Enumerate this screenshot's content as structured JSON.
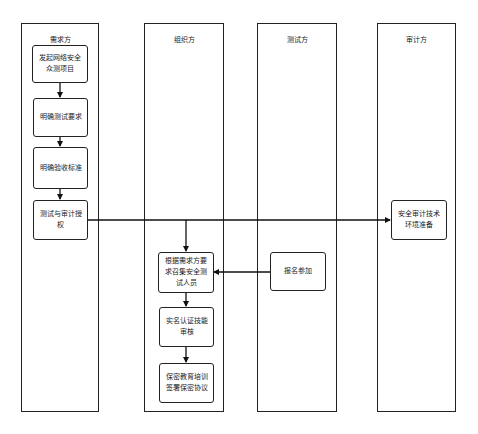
{
  "diagram": {
    "type": "swimlane-flowchart",
    "lanes": [
      {
        "id": "demand",
        "title": "需求方"
      },
      {
        "id": "organizer",
        "title": "组织方"
      },
      {
        "id": "tester",
        "title": "测试方"
      },
      {
        "id": "auditor",
        "title": "审计方"
      }
    ],
    "nodes": {
      "launch": "发起网络安全众测项目",
      "define_test": "明确测试要求",
      "define_accept": "明确验收标准",
      "authorize": "测试与审计授权",
      "audit_prep": "安全审计技术环境准备",
      "recruit": "根据需求方要求召集安全测试人员",
      "signup": "报名参加",
      "verify": "实名认证技能审核",
      "nda": "保密教育培训签署保密协议"
    },
    "edges": [
      {
        "from": "launch",
        "to": "define_test"
      },
      {
        "from": "define_test",
        "to": "define_accept"
      },
      {
        "from": "define_accept",
        "to": "authorize"
      },
      {
        "from": "authorize",
        "to": "audit_prep"
      },
      {
        "from": "authorize",
        "to": "recruit"
      },
      {
        "from": "signup",
        "to": "recruit"
      },
      {
        "from": "recruit",
        "to": "verify"
      },
      {
        "from": "verify",
        "to": "nda"
      }
    ]
  }
}
